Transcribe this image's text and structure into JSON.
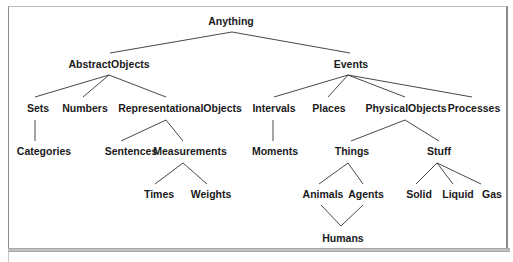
{
  "diagram": {
    "type": "taxonomy-tree",
    "line_color": "#333333",
    "nodes": {
      "anything": "Anything",
      "abstract_objects": "AbstractObjects",
      "events": "Events",
      "sets": "Sets",
      "numbers": "Numbers",
      "representational_objects": "RepresentationalObjects",
      "intervals": "Intervals",
      "places": "Places",
      "physical_objects": "PhysicalObjects",
      "processes": "Processes",
      "categories": "Categories",
      "sentences": "Sentences",
      "measurements": "Measurements",
      "moments": "Moments",
      "things": "Things",
      "stuff": "Stuff",
      "times": "Times",
      "weights": "Weights",
      "animals": "Animals",
      "agents": "Agents",
      "solid": "Solid",
      "liquid": "Liquid",
      "gas": "Gas",
      "humans": "Humans"
    },
    "edges": [
      [
        "Anything",
        "AbstractObjects"
      ],
      [
        "Anything",
        "Events"
      ],
      [
        "AbstractObjects",
        "Sets"
      ],
      [
        "AbstractObjects",
        "Numbers"
      ],
      [
        "AbstractObjects",
        "RepresentationalObjects"
      ],
      [
        "Events",
        "Intervals"
      ],
      [
        "Events",
        "Places"
      ],
      [
        "Events",
        "PhysicalObjects"
      ],
      [
        "Events",
        "Processes"
      ],
      [
        "Sets",
        "Categories"
      ],
      [
        "RepresentationalObjects",
        "Sentences"
      ],
      [
        "RepresentationalObjects",
        "Measurements"
      ],
      [
        "Intervals",
        "Moments"
      ],
      [
        "PhysicalObjects",
        "Things"
      ],
      [
        "PhysicalObjects",
        "Stuff"
      ],
      [
        "Measurements",
        "Times"
      ],
      [
        "Measurements",
        "Weights"
      ],
      [
        "Things",
        "Animals"
      ],
      [
        "Things",
        "Agents"
      ],
      [
        "Stuff",
        "Solid"
      ],
      [
        "Stuff",
        "Liquid"
      ],
      [
        "Stuff",
        "Gas"
      ],
      [
        "Animals",
        "Humans"
      ],
      [
        "Agents",
        "Humans"
      ]
    ]
  }
}
